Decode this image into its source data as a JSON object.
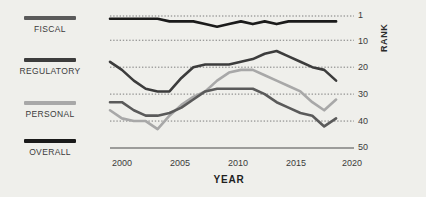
{
  "legend": {
    "items": [
      {
        "label": "FISCAL",
        "color": "#5a5a5a"
      },
      {
        "label": "REGULATORY",
        "color": "#3c3c3c"
      },
      {
        "label": "PERSONAL",
        "color": "#a8a8a8"
      },
      {
        "label": "OVERALL",
        "color": "#1a1a1a"
      }
    ]
  },
  "axes": {
    "x_title": "YEAR",
    "y_title": "RANK",
    "x_ticks": [
      "2000",
      "2005",
      "2010",
      "2015",
      "2020"
    ],
    "y_ticks": [
      "1",
      "10",
      "20",
      "30",
      "40",
      "50"
    ]
  },
  "chart_data": {
    "type": "line",
    "title": "",
    "xlabel": "YEAR",
    "ylabel": "RANK",
    "xlim": [
      2000,
      2020
    ],
    "ylim": [
      1,
      50
    ],
    "y_inverted": true,
    "grid": true,
    "grid_style": "dotted",
    "legend_position": "left",
    "x": [
      2000,
      2001,
      2002,
      2003,
      2004,
      2005,
      2006,
      2007,
      2008,
      2009,
      2010,
      2011,
      2012,
      2013,
      2014,
      2015,
      2016,
      2017,
      2018,
      2019
    ],
    "series": [
      {
        "name": "OVERALL",
        "color": "#1a1a1a",
        "values": [
          2,
          2,
          2,
          2,
          2,
          3,
          3,
          3,
          4,
          5,
          4,
          3,
          4,
          3,
          4,
          3,
          3,
          3,
          3,
          3
        ]
      },
      {
        "name": "REGULATORY",
        "color": "#3c3c3c",
        "values": [
          18,
          21,
          25,
          28,
          29,
          29,
          24,
          20,
          19,
          19,
          19,
          18,
          17,
          15,
          14,
          16,
          18,
          20,
          21,
          25
        ]
      },
      {
        "name": "FISCAL",
        "color": "#5a5a5a",
        "values": [
          33,
          33,
          36,
          38,
          38,
          37,
          35,
          32,
          29,
          28,
          28,
          28,
          28,
          30,
          33,
          35,
          37,
          38,
          42,
          39
        ]
      },
      {
        "name": "PERSONAL",
        "color": "#a8a8a8",
        "values": [
          36,
          39,
          40,
          40,
          43,
          38,
          34,
          31,
          29,
          25,
          22,
          21,
          21,
          23,
          25,
          27,
          29,
          33,
          36,
          32
        ]
      }
    ]
  }
}
